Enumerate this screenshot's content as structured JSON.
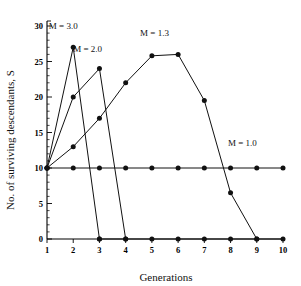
{
  "chart_data": {
    "type": "line",
    "title": "",
    "xlabel": "Generations",
    "ylabel": "No. of surviving descendants, S",
    "xlim": [
      1,
      10
    ],
    "ylim": [
      0,
      30
    ],
    "x": [
      1,
      2,
      3,
      4,
      5,
      6,
      7,
      8,
      9,
      10
    ],
    "xticks": [
      "1",
      "2",
      "3",
      "4",
      "5",
      "6",
      "7",
      "8",
      "9",
      "10"
    ],
    "yticks": [
      "0",
      "5",
      "10",
      "15",
      "20",
      "25",
      "30"
    ],
    "ytick_values": [
      0,
      5,
      10,
      15,
      20,
      25,
      30
    ],
    "minor_tick_step": 1,
    "grid": false,
    "legend_position": "inline-annotations",
    "marker": "filled-circle",
    "line_color": "#111111",
    "series": [
      {
        "name": "M = 3.0",
        "label": "M = 3.0",
        "x": [
          1,
          2,
          3
        ],
        "values": [
          10,
          27,
          0
        ]
      },
      {
        "name": "M = 2.0",
        "label": "M = 2.0",
        "x": [
          1,
          2,
          3,
          4
        ],
        "values": [
          10,
          20,
          24,
          0
        ]
      },
      {
        "name": "M = 1.3",
        "label": "M = 1.3",
        "x": [
          1,
          2,
          3,
          4,
          5,
          6,
          7,
          8,
          9
        ],
        "values": [
          10,
          13,
          17,
          22,
          25.8,
          26,
          19.5,
          6.5,
          0
        ]
      },
      {
        "name": "M = 1.0",
        "label": "M = 1.0",
        "x": [
          1,
          2,
          3,
          4,
          5,
          6,
          7,
          8,
          9,
          10
        ],
        "values": [
          10,
          10,
          10,
          10,
          10,
          10,
          10,
          10,
          10,
          10
        ]
      }
    ],
    "baseline_series": {
      "name": "zero-baseline",
      "x": [
        3,
        4,
        5,
        6,
        7,
        8,
        9,
        10
      ],
      "values": [
        0,
        0,
        0,
        0,
        0,
        0,
        0,
        0
      ]
    },
    "annotations": [
      {
        "text": "M = 3.0",
        "x": 1.62,
        "y": 29.6
      },
      {
        "text": "M = 2.0",
        "x": 2.55,
        "y": 26.3
      },
      {
        "text": "M = 1.3",
        "x": 5.1,
        "y": 28.6
      },
      {
        "text": "M = 1.0",
        "x": 8.45,
        "y": 13.1
      }
    ]
  }
}
